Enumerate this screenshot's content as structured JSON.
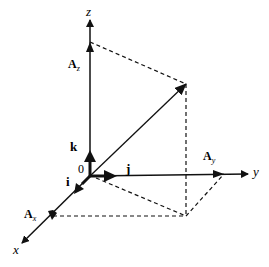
{
  "diagram": {
    "type": "3d-vector-components",
    "axes": {
      "x": "x",
      "y": "y",
      "z": "z"
    },
    "origin_label": "0",
    "unit_vectors": {
      "i": "i",
      "j": "j",
      "k": "k"
    },
    "components": {
      "Ax": {
        "base": "A",
        "sub": "x"
      },
      "Ay": {
        "base": "A",
        "sub": "y"
      },
      "Az": {
        "base": "A",
        "sub": "z"
      }
    },
    "colors": {
      "ink": "#111111",
      "background": "#ffffff"
    }
  }
}
